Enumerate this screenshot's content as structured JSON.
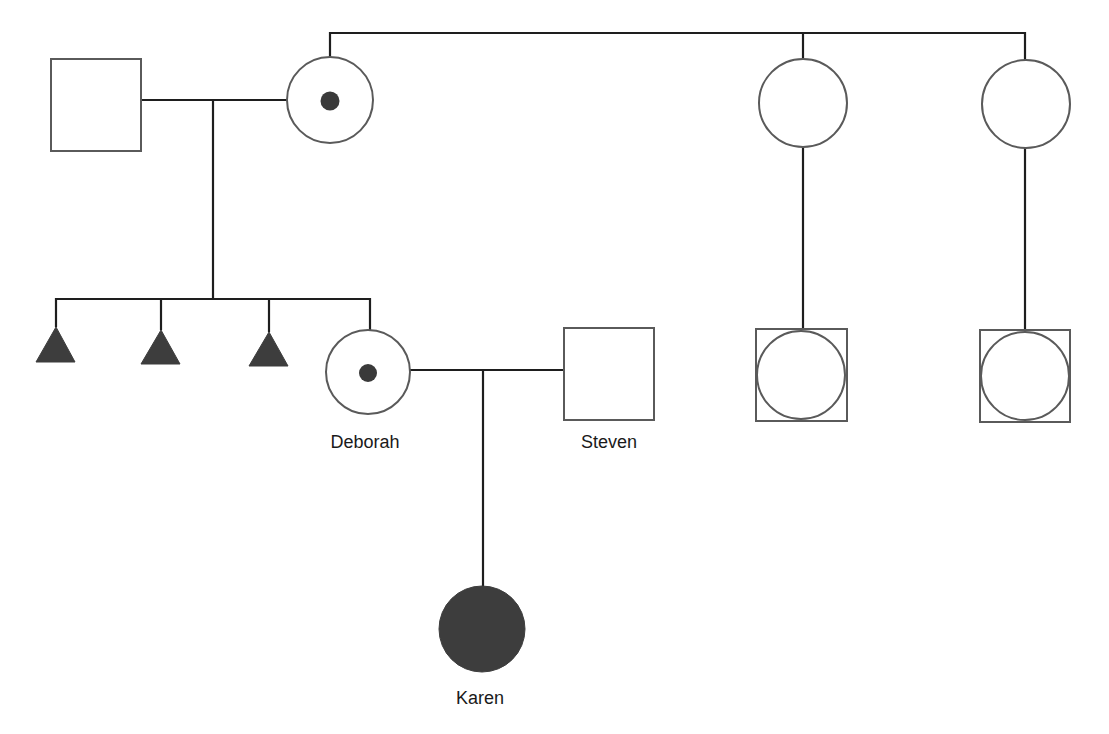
{
  "diagram": {
    "type": "pedigree",
    "colors": {
      "line": "#1e1e1e",
      "outline": "#5a5a5a",
      "affected_fill": "#3d3d3d",
      "carrier_dot": "#3a3a3a",
      "background": "#ffffff"
    },
    "individuals": [
      {
        "id": "grandfather",
        "sex": "male",
        "status": "unaffected",
        "label": ""
      },
      {
        "id": "grandmother",
        "sex": "female",
        "status": "carrier",
        "label": ""
      },
      {
        "id": "great-aunt-1",
        "sex": "female",
        "status": "unaffected",
        "label": ""
      },
      {
        "id": "great-aunt-2",
        "sex": "female",
        "status": "unaffected",
        "label": ""
      },
      {
        "id": "miscarriage-1",
        "sex": "unknown",
        "status": "affected-pregnancy-loss",
        "label": ""
      },
      {
        "id": "miscarriage-2",
        "sex": "unknown",
        "status": "affected-pregnancy-loss",
        "label": ""
      },
      {
        "id": "miscarriage-3",
        "sex": "unknown",
        "status": "affected-pregnancy-loss",
        "label": ""
      },
      {
        "id": "deborah",
        "sex": "female",
        "status": "carrier",
        "label": "Deborah"
      },
      {
        "id": "steven",
        "sex": "male",
        "status": "unaffected",
        "label": "Steven"
      },
      {
        "id": "cousin-1",
        "sex": "unknown",
        "status": "unaffected",
        "label": ""
      },
      {
        "id": "cousin-2",
        "sex": "unknown",
        "status": "unaffected",
        "label": ""
      },
      {
        "id": "karen",
        "sex": "female",
        "status": "affected",
        "label": "Karen"
      }
    ],
    "labels": {
      "deborah": "Deborah",
      "steven": "Steven",
      "karen": "Karen"
    }
  }
}
